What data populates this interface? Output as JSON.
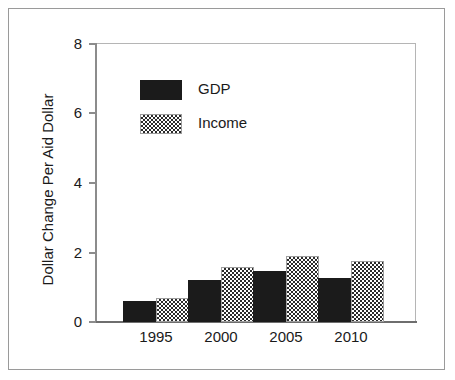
{
  "chart_data": {
    "type": "bar",
    "title": "",
    "subtitle": "",
    "xlabel": "",
    "ylabel": "Dollar Change Per Aid Dollar",
    "categories": [
      "1995",
      "2000",
      "2005",
      "2010"
    ],
    "series": [
      {
        "name": "GDP",
        "values": [
          0.6,
          1.2,
          1.45,
          1.25
        ],
        "color": "#1b1b1b",
        "fill": "solid-black"
      },
      {
        "name": "Income",
        "values": [
          0.7,
          1.57,
          1.9,
          1.75
        ],
        "color": "#808080",
        "fill": "checkerboard-gray"
      }
    ],
    "ylim": [
      0,
      8
    ],
    "yticks": [
      0,
      2,
      4,
      6,
      8
    ],
    "ytick_labels": [
      "0",
      "2",
      "4",
      "6",
      "8"
    ],
    "grid": false,
    "legend_position": "upper-left-inside",
    "axis_color": "#8c8c8c",
    "frame_color": "#9a9a9a",
    "background": "#ffffff"
  },
  "legend": {
    "entries": [
      {
        "label": "GDP",
        "swatch": "solid-black-swatch"
      },
      {
        "label": "Income",
        "swatch": "checkered-gray-swatch"
      }
    ]
  },
  "axes": {
    "y_title": "Dollar Change Per Aid Dollar",
    "y_labels": [
      "8",
      "6",
      "4",
      "2",
      "0"
    ],
    "x_labels": [
      "1995",
      "2000",
      "2005",
      "2010"
    ]
  }
}
